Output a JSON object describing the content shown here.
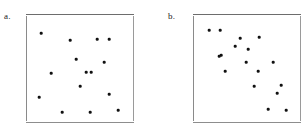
{
  "figure": {
    "background_color": "#ffffff",
    "point_color": "#111111",
    "axis_color": "#8a8a8a"
  },
  "chart_data": [
    {
      "type": "scatter",
      "title": "a.",
      "label": "a.",
      "xlabel": "",
      "ylabel": "",
      "xlim": [
        0,
        100
      ],
      "ylim": [
        0,
        100
      ],
      "grid": false,
      "legend": "none",
      "axes_frame": {
        "left": 26,
        "top": 14,
        "width": 108,
        "height": 108
      },
      "n_points": 15,
      "x": [
        13.9,
        40.7,
        65.7,
        76.9,
        23.1,
        72.2,
        46.3,
        55.6,
        15.7,
        30.4,
        76.9,
        12.0,
        33.3,
        59.3,
        85.2
      ],
      "y": [
        82.4,
        75.0,
        76.9,
        76.9,
        55.6,
        55.6,
        60.2,
        46.3,
        45.4,
        33.3,
        35.2,
        23.1,
        11.1,
        11.1,
        13.0
      ],
      "points": [
        {
          "x": 41,
          "y": 33
        },
        {
          "x": 70,
          "y": 40
        },
        {
          "x": 97,
          "y": 39
        },
        {
          "x": 109,
          "y": 39
        },
        {
          "x": 51,
          "y": 73
        },
        {
          "x": 104,
          "y": 62
        },
        {
          "x": 76,
          "y": 59
        },
        {
          "x": 86,
          "y": 72
        },
        {
          "x": 91,
          "y": 72
        },
        {
          "x": 80,
          "y": 86
        },
        {
          "x": 109,
          "y": 94
        },
        {
          "x": 39,
          "y": 97
        },
        {
          "x": 62,
          "y": 112
        },
        {
          "x": 90,
          "y": 112
        },
        {
          "x": 118,
          "y": 110
        }
      ]
    },
    {
      "type": "scatter",
      "title": "b.",
      "label": "b.",
      "xlabel": "",
      "ylabel": "",
      "xlim": [
        0,
        100
      ],
      "ylim": [
        0,
        100
      ],
      "grid": false,
      "legend": "none",
      "axes_frame": {
        "left": 193,
        "top": 14,
        "width": 108,
        "height": 108
      },
      "n_points": 17,
      "x": [
        14.8,
        25.0,
        43.5,
        38.9,
        24.1,
        61.1,
        51.9,
        25.9,
        30.6,
        60.2,
        49.1,
        56.5,
        81.5,
        77.8,
        69.4,
        86.1,
        74.1
      ],
      "y": [
        85.2,
        85.2,
        77.8,
        70.4,
        61.1,
        78.7,
        55.6,
        47.2,
        47.2,
        56.5,
        39.8,
        47.2,
        56.5,
        47.2,
        32.4,
        32.4,
        12.0
      ],
      "points": [
        {
          "x": 209,
          "y": 30
        },
        {
          "x": 220,
          "y": 30
        },
        {
          "x": 240,
          "y": 38
        },
        {
          "x": 259,
          "y": 37
        },
        {
          "x": 235,
          "y": 46
        },
        {
          "x": 221,
          "y": 55
        },
        {
          "x": 248,
          "y": 49
        },
        {
          "x": 246,
          "y": 62
        },
        {
          "x": 273,
          "y": 62
        },
        {
          "x": 219,
          "y": 56
        },
        {
          "x": 225,
          "y": 71
        },
        {
          "x": 258,
          "y": 71
        },
        {
          "x": 254,
          "y": 86
        },
        {
          "x": 281,
          "y": 85
        },
        {
          "x": 277,
          "y": 93
        },
        {
          "x": 268,
          "y": 109
        },
        {
          "x": 286,
          "y": 110
        }
      ]
    }
  ]
}
